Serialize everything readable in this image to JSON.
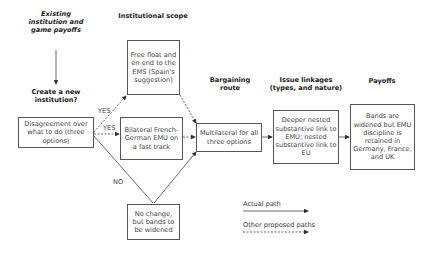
{
  "headers": {
    "existing": "Existing institution and game payoffs",
    "create": "Create a new institution?",
    "scope": "Institutional scope",
    "bargaining": "Bargaining route",
    "issue": "Issue linkages (types, and nature)",
    "payoffs": "Payoffs"
  },
  "boxes": {
    "disagreement": "Disagreement over what to do (three options)",
    "free_float": "Free float and en end to the EMS (Spain's suggestion)",
    "bilateral": "Bilateral French-German EMU on a fast track",
    "no_change": "No change, but bands to be widened",
    "multilateral": "Multilateral for all three options",
    "issue": "Deeper nested substantive link to EMU; nested substantive link to EU",
    "payoffs": "Bands are widened but EMU discipline is retained in Germany, France, and UK"
  },
  "edges": {
    "yes1": "YES",
    "yes2": "YES",
    "no": "NO"
  },
  "legend": {
    "actual": "Actual path",
    "other": "Other proposed paths"
  }
}
